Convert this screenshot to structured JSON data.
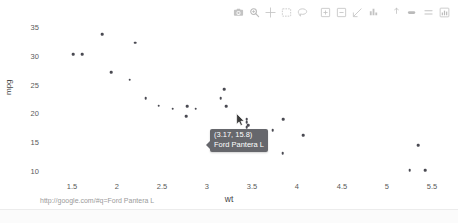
{
  "chart_data": {
    "type": "scatter",
    "title": "",
    "xlabel": "wt",
    "ylabel": "mpg",
    "xlim": [
      1.2,
      5.7
    ],
    "ylim": [
      9.0,
      36.0
    ],
    "grid": false,
    "legend": "none",
    "xticks": [
      "1.5",
      "2",
      "2.5",
      "3",
      "3.5",
      "4",
      "4.5",
      "5",
      "5.5"
    ],
    "xtick_values": [
      1.5,
      2,
      2.5,
      3,
      3.5,
      4,
      4.5,
      5,
      5.5
    ],
    "yticks": [
      "35",
      "30",
      "25",
      "20",
      "15",
      "10"
    ],
    "ytick_values": [
      35,
      30,
      25,
      20,
      15,
      10
    ],
    "marker_color": "#4a4a52",
    "points": [
      {
        "label": "Lotus Europa",
        "x": 1.513,
        "y": 30.4
      },
      {
        "label": "Honda Civic",
        "x": 1.615,
        "y": 30.4
      },
      {
        "label": "Toyota Corolla",
        "x": 1.835,
        "y": 33.9
      },
      {
        "label": "Fiat 128",
        "x": 2.2,
        "y": 32.4
      },
      {
        "label": "Fiat X1-9",
        "x": 1.935,
        "y": 27.3
      },
      {
        "label": "Porsche 914-2",
        "x": 2.14,
        "y": 26.0
      },
      {
        "label": "Datsun 710",
        "x": 2.32,
        "y": 22.8
      },
      {
        "label": "Merc 230",
        "x": 3.15,
        "y": 22.8
      },
      {
        "label": "Merc 240D",
        "x": 3.19,
        "y": 24.4
      },
      {
        "label": "Toyota Corona",
        "x": 2.465,
        "y": 21.5
      },
      {
        "label": "Hornet 4 Drive",
        "x": 3.215,
        "y": 21.4
      },
      {
        "label": "Mazda RX4",
        "x": 2.62,
        "y": 21.0
      },
      {
        "label": "Mazda RX4 Wag",
        "x": 2.875,
        "y": 21.0
      },
      {
        "label": "Volvo 142E",
        "x": 2.78,
        "y": 21.4
      },
      {
        "label": "Datsun 510",
        "x": 2.77,
        "y": 19.7
      },
      {
        "label": "Pontiac Firebird",
        "x": 3.845,
        "y": 19.2
      },
      {
        "label": "Merc 280",
        "x": 3.44,
        "y": 19.2
      },
      {
        "label": "Merc 280C",
        "x": 3.44,
        "y": 17.8
      },
      {
        "label": "Valiant",
        "x": 3.46,
        "y": 18.1
      },
      {
        "label": "Hornet Sportabout",
        "x": 3.44,
        "y": 18.7
      },
      {
        "label": "Merc 450SE",
        "x": 4.07,
        "y": 16.4
      },
      {
        "label": "Merc 450SL",
        "x": 3.73,
        "y": 17.3
      },
      {
        "label": "Ford Pantera L",
        "x": 3.17,
        "y": 15.8,
        "highlight": true
      },
      {
        "label": "Dodge Challenger",
        "x": 3.52,
        "y": 15.5
      },
      {
        "label": "AMC Javelin",
        "x": 3.435,
        "y": 15.2
      },
      {
        "label": "Maserati Bora",
        "x": 3.57,
        "y": 15.0
      },
      {
        "label": "Camaro Z28",
        "x": 3.84,
        "y": 13.3
      },
      {
        "label": "Chrysler Imperial",
        "x": 5.345,
        "y": 14.7
      },
      {
        "label": "Cadillac Fleetwood",
        "x": 5.25,
        "y": 10.4
      },
      {
        "label": "Lincoln Continental",
        "x": 5.424,
        "y": 10.4
      }
    ]
  },
  "tooltip": {
    "coords": "(3.17, 15.8)",
    "label": "Ford Pantera L"
  },
  "modebar": {
    "buttons": [
      {
        "name": "camera-icon",
        "title": "Download plot as a png"
      },
      {
        "name": "zoom-magnifier-icon",
        "title": "Zoom"
      },
      {
        "name": "pan-crosshair-icon",
        "title": "Pan"
      },
      {
        "name": "box-select-icon",
        "title": "Box Select"
      },
      {
        "name": "lasso-select-icon",
        "title": "Lasso Select"
      },
      {
        "name": "zoom-in-icon",
        "title": "Zoom in"
      },
      {
        "name": "zoom-out-icon",
        "title": "Zoom out"
      },
      {
        "name": "autoscale-icon",
        "title": "Autoscale"
      },
      {
        "name": "reset-axes-icon",
        "title": "Reset axes"
      },
      {
        "name": "spike-lines-icon",
        "title": "Toggle Spike Lines"
      },
      {
        "name": "hover-closest-icon",
        "title": "Show closest data on hover"
      },
      {
        "name": "hover-compare-icon",
        "title": "Compare data on hover"
      },
      {
        "name": "plotly-logo-icon",
        "title": "Produced with Plotly"
      }
    ]
  },
  "statusbar": {
    "url": "http://google.com/#q=Ford Pantera L"
  }
}
